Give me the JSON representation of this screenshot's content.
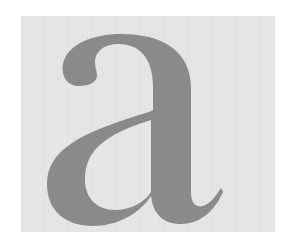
{
  "image": {
    "glyph": "a",
    "colors": {
      "background": "#ffffff",
      "panel": "#e6e6e6",
      "glyph": "#8a8a8a"
    }
  }
}
